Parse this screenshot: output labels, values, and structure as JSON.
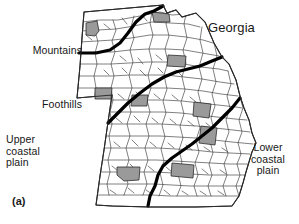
{
  "figure": {
    "panel_label": "(a)",
    "state_label": "Georgia",
    "regions": [
      {
        "key": "mountains",
        "label": "Mountains"
      },
      {
        "key": "foothills",
        "label": "Foothills"
      },
      {
        "key": "upper_coastal_plain",
        "label": "Upper\ncoastal\nplain"
      },
      {
        "key": "lower_coastal_plain",
        "label": "Lower\ncoastal\nplain"
      }
    ],
    "colors": {
      "county_fill": "#ffffff",
      "county_stroke": "#2b2b2b",
      "highlight_fill": "#9a9a9a",
      "highlight_stroke": "#2b2b2b",
      "region_divider": "#000000",
      "background": "#ffffff",
      "text": "#171717"
    },
    "map": {
      "name": "georgia-county-map",
      "highlighted_county_count": 10,
      "region_divider_count": 3
    }
  }
}
